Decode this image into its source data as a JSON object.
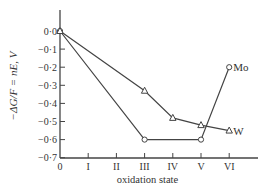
{
  "chart_data": {
    "type": "line",
    "title": "",
    "xlabel": "oxidation state",
    "ylabel": "−ΔG/F = nE, V",
    "categories": [
      "0",
      "I",
      "II",
      "III",
      "IV",
      "V",
      "VI"
    ],
    "x_ticks": [
      "0",
      "I",
      "II",
      "III",
      "IV",
      "V",
      "VI"
    ],
    "y_ticks": [
      "0·0",
      "−0·1",
      "−0·2",
      "−0·3",
      "−0·4",
      "−0·5",
      "−0·6",
      "−0·7"
    ],
    "ylim": [
      -0.7,
      0.0
    ],
    "grid": false,
    "series": [
      {
        "name": "Mo",
        "marker": "circle",
        "x": [
          0,
          3,
          5,
          6
        ],
        "values": [
          0.0,
          -0.6,
          -0.6,
          -0.2
        ]
      },
      {
        "name": "W",
        "marker": "triangle",
        "x": [
          0,
          3,
          4,
          5,
          6
        ],
        "values": [
          0.0,
          -0.33,
          -0.48,
          -0.52,
          -0.55
        ]
      }
    ],
    "annotations": [
      "Mo",
      "W"
    ]
  }
}
